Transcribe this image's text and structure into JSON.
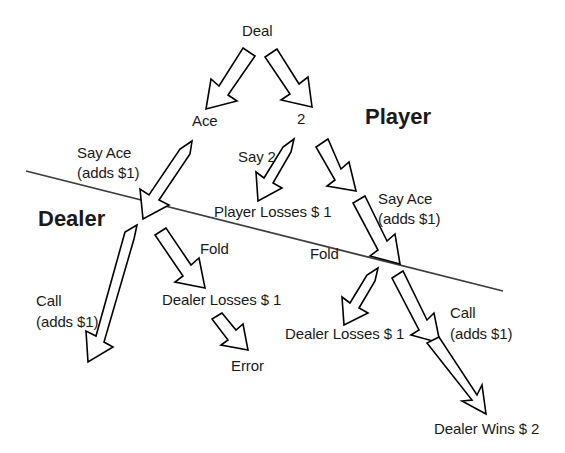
{
  "diagram": {
    "type": "decision-tree",
    "regions": [
      {
        "id": "player",
        "label": "Player",
        "x": 365,
        "y": 104
      },
      {
        "id": "dealer",
        "label": "Dealer",
        "x": 38,
        "y": 206
      }
    ],
    "divider": {
      "x1": 26,
      "y1": 171,
      "x2": 503,
      "y2": 291
    },
    "nodes": [
      {
        "id": "deal",
        "label": "Deal",
        "x": 242,
        "y": 22,
        "kind": "root"
      },
      {
        "id": "ace",
        "label": "Ace",
        "x": 192,
        "y": 112,
        "kind": "card"
      },
      {
        "id": "two",
        "label": "2",
        "x": 297,
        "y": 110,
        "kind": "card"
      },
      {
        "id": "say-ace-left",
        "label": "Say Ace",
        "x": 77,
        "y": 144,
        "kind": "action"
      },
      {
        "id": "say-ace-left-2",
        "label": "(adds $1)",
        "x": 77,
        "y": 164,
        "kind": "action-cost"
      },
      {
        "id": "say-2",
        "label": "Say 2",
        "x": 238,
        "y": 148,
        "kind": "action"
      },
      {
        "id": "say-ace-right",
        "label": "Say Ace",
        "x": 378,
        "y": 190,
        "kind": "action"
      },
      {
        "id": "say-ace-right-2",
        "label": "(adds $1)",
        "x": 378,
        "y": 210,
        "kind": "action-cost"
      },
      {
        "id": "player-losses",
        "label": "Player Losses $ 1",
        "x": 214,
        "y": 203,
        "kind": "outcome"
      },
      {
        "id": "fold-left",
        "label": "Fold",
        "x": 200,
        "y": 240,
        "kind": "action"
      },
      {
        "id": "call-left",
        "label": "Call",
        "x": 36,
        "y": 292,
        "kind": "action"
      },
      {
        "id": "call-left-2",
        "label": "(adds $1)",
        "x": 36,
        "y": 313,
        "kind": "action-cost"
      },
      {
        "id": "dealer-losses-1",
        "label": "Dealer Losses $ 1",
        "x": 162,
        "y": 291,
        "kind": "outcome"
      },
      {
        "id": "error",
        "label": "Error",
        "x": 231,
        "y": 357,
        "kind": "outcome"
      },
      {
        "id": "fold-right",
        "label": "Fold",
        "x": 310,
        "y": 245,
        "kind": "action"
      },
      {
        "id": "dealer-losses-2",
        "label": "Dealer Losses $ 1",
        "x": 285,
        "y": 325,
        "kind": "outcome"
      },
      {
        "id": "call-right",
        "label": "Call",
        "x": 450,
        "y": 304,
        "kind": "action"
      },
      {
        "id": "call-right-2",
        "label": "(adds $1)",
        "x": 450,
        "y": 325,
        "kind": "action-cost"
      },
      {
        "id": "dealer-wins",
        "label": "Dealer Wins $ 2",
        "x": 434,
        "y": 420,
        "kind": "outcome"
      }
    ],
    "edges": [
      {
        "id": "deal-to-ace",
        "from": "deal",
        "to": "ace"
      },
      {
        "id": "deal-to-two",
        "from": "deal",
        "to": "two"
      },
      {
        "id": "ace-to-say-ace",
        "from": "ace",
        "to": "say-ace-left"
      },
      {
        "id": "two-to-say-2",
        "from": "two",
        "to": "say-2"
      },
      {
        "id": "two-to-say-ace",
        "from": "two",
        "to": "say-ace-right"
      },
      {
        "id": "say2-to-player-losses",
        "from": "say-2",
        "to": "player-losses"
      },
      {
        "id": "sayace-to-call-left",
        "from": "say-ace-left",
        "to": "call-left"
      },
      {
        "id": "sayace-to-fold-left",
        "from": "say-ace-left",
        "to": "dealer-losses-1"
      },
      {
        "id": "dealerlosses-to-error",
        "from": "dealer-losses-1",
        "to": "error"
      },
      {
        "id": "sayace-to-fold-right",
        "from": "say-ace-right",
        "to": "dealer-losses-2"
      },
      {
        "id": "sayace-to-call-right",
        "from": "say-ace-right",
        "to": "dealer-wins"
      }
    ],
    "colors": {
      "text": "#1a1a1a",
      "arrow_fill": "#ffffff",
      "arrow_stroke": "#000000",
      "divider": "#3d3d3d",
      "background": "#ffffff"
    }
  }
}
